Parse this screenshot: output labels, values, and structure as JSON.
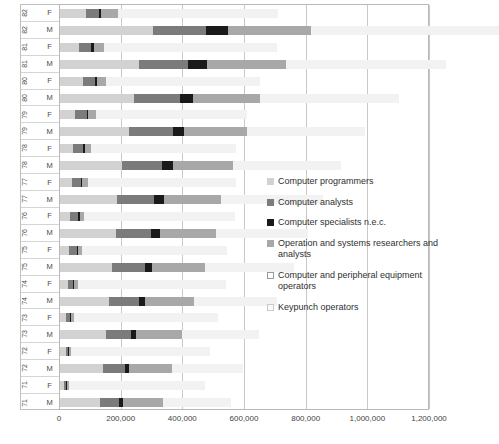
{
  "chart_data": {
    "type": "bar",
    "orientation": "horizontal",
    "stacked": true,
    "title": "",
    "xlabel": "",
    "ylabel": "",
    "xlim": [
      0,
      1200000
    ],
    "xticks": [
      0,
      200000,
      400000,
      600000,
      800000,
      1000000,
      1200000
    ],
    "xtick_labels": [
      "0",
      "200,000",
      "400,000",
      "600,000",
      "800,000",
      "1,000,000",
      "1,200,000"
    ],
    "grid": "vertical",
    "legend_position": "inside-right",
    "categories": [
      "82 F",
      "82 M",
      "81 F",
      "81 M",
      "80 F",
      "80 M",
      "79 F",
      "79 M",
      "78 F",
      "78 M",
      "77 F",
      "77 M",
      "76 F",
      "76 M",
      "75 F",
      "75 M",
      "74 F",
      "74 M",
      "73 F",
      "73 M",
      "72 F",
      "72 M",
      "71 F",
      "71 M"
    ],
    "category_years": [
      "82",
      "82",
      "81",
      "81",
      "80",
      "80",
      "79",
      "79",
      "78",
      "78",
      "77",
      "77",
      "76",
      "76",
      "75",
      "75",
      "74",
      "74",
      "73",
      "73",
      "72",
      "72",
      "71",
      "71"
    ],
    "category_sexes": [
      "F",
      "M",
      "F",
      "M",
      "F",
      "M",
      "F",
      "M",
      "F",
      "M",
      "F",
      "M",
      "F",
      "M",
      "F",
      "M",
      "F",
      "M",
      "F",
      "M",
      "F",
      "M",
      "F",
      "M"
    ],
    "series": [
      {
        "name": "Computer programmers",
        "color": "#d2d2d2",
        "values": [
          85000,
          300000,
          60000,
          255000,
          75000,
          240000,
          50000,
          225000,
          42000,
          200000,
          38000,
          185000,
          34000,
          180000,
          30000,
          170000,
          25000,
          160000,
          20000,
          150000,
          18000,
          140000,
          14000,
          130000
        ]
      },
      {
        "name": "Computer analysts",
        "color": "#7b7b7b",
        "values": [
          40000,
          175000,
          42000,
          160000,
          38000,
          150000,
          36000,
          140000,
          34000,
          130000,
          30000,
          120000,
          26000,
          115000,
          24000,
          105000,
          18000,
          95000,
          12000,
          80000,
          9000,
          70000,
          7000,
          60000
        ]
      },
      {
        "name": "Computer specialists n.e.c.",
        "color": "#1a1a1a",
        "values": [
          8000,
          70000,
          7000,
          62000,
          7000,
          40000,
          5000,
          38000,
          5000,
          35000,
          5000,
          32000,
          5000,
          30000,
          5000,
          25000,
          4000,
          20000,
          4000,
          16000,
          3000,
          14000,
          3000,
          15000
        ]
      },
      {
        "name": "Operation and systems researchers and analysts",
        "color": "#a8a8a8",
        "values": [
          55000,
          270000,
          35000,
          255000,
          30000,
          220000,
          25000,
          205000,
          20000,
          195000,
          18000,
          185000,
          14000,
          180000,
          12000,
          170000,
          10000,
          160000,
          8000,
          150000,
          7000,
          140000,
          6000,
          130000
        ]
      },
      {
        "name": "Computer and peripheral equipment operators",
        "color": "#ffffff",
        "values": [
          0,
          0,
          0,
          0,
          0,
          0,
          0,
          0,
          0,
          0,
          0,
          0,
          0,
          0,
          0,
          0,
          0,
          0,
          0,
          0,
          0,
          0,
          0,
          0
        ]
      },
      {
        "name": "Keypunch operators",
        "color": "#f2f2f2",
        "values": [
          520000,
          610000,
          560000,
          520000,
          500000,
          450000,
          490000,
          380000,
          470000,
          350000,
          480000,
          330000,
          490000,
          300000,
          470000,
          290000,
          480000,
          270000,
          470000,
          250000,
          450000,
          230000,
          440000,
          220000
        ]
      }
    ]
  },
  "legend": {
    "items": [
      {
        "label": "Computer programmers",
        "swatch": "s0"
      },
      {
        "label": "Computer analysts",
        "swatch": "s1"
      },
      {
        "label": "Computer specialists n.e.c.",
        "swatch": "s2"
      },
      {
        "label": "Operation and systems researchers and analysts",
        "swatch": "s3"
      },
      {
        "label": "Computer and peripheral equipment operators",
        "swatch": "s4"
      },
      {
        "label": "Keypunch operators",
        "swatch": "s5"
      }
    ]
  }
}
